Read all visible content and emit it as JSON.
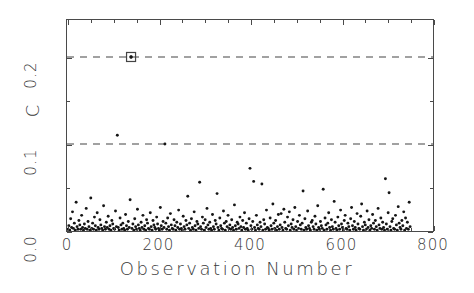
{
  "chart_data": {
    "type": "scatter",
    "title": "",
    "xlabel": "Observation Number",
    "ylabel": "C",
    "xlim": [
      0,
      800
    ],
    "ylim": [
      0.0,
      0.2425
    ],
    "grid": false,
    "legend": null,
    "x_ticks": [
      "0",
      "200",
      "400",
      "600",
      "800"
    ],
    "x_tick_values": [
      0,
      200,
      400,
      600,
      800
    ],
    "x_minor_step": 50,
    "y_ticks": [
      "0.0",
      "0.1",
      "0.2"
    ],
    "y_tick_values": [
      0.0,
      0.1,
      0.2
    ],
    "y_minor_step": 0.05,
    "reference_lines": [
      {
        "y": 0.1,
        "style": "dashed",
        "label": ""
      },
      {
        "y": 0.2,
        "style": "dashed",
        "label": ""
      }
    ],
    "highlighted_point": {
      "x": 140,
      "y": 0.2,
      "marker": "open-square"
    },
    "marker": "filled-dot",
    "point_color": "#151515",
    "n_points": 752,
    "x": [
      2,
      4,
      6,
      8,
      10,
      12,
      14,
      16,
      18,
      20,
      22,
      24,
      26,
      28,
      30,
      32,
      34,
      36,
      38,
      40,
      42,
      44,
      46,
      48,
      50,
      52,
      54,
      56,
      58,
      60,
      62,
      64,
      66,
      68,
      70,
      72,
      74,
      76,
      78,
      80,
      82,
      84,
      86,
      88,
      90,
      92,
      94,
      96,
      98,
      100,
      102,
      104,
      106,
      108,
      110,
      112,
      114,
      116,
      118,
      120,
      122,
      124,
      126,
      128,
      130,
      132,
      134,
      136,
      138,
      140,
      142,
      144,
      146,
      148,
      150,
      152,
      154,
      156,
      158,
      160,
      162,
      164,
      166,
      168,
      170,
      172,
      174,
      176,
      178,
      180,
      182,
      184,
      186,
      188,
      190,
      192,
      194,
      196,
      198,
      200,
      202,
      204,
      206,
      208,
      210,
      212,
      214,
      216,
      218,
      220,
      222,
      224,
      226,
      228,
      230,
      232,
      234,
      236,
      238,
      240,
      242,
      244,
      246,
      248,
      250,
      252,
      254,
      256,
      258,
      260,
      262,
      264,
      266,
      268,
      270,
      272,
      274,
      276,
      278,
      280,
      282,
      284,
      286,
      288,
      290,
      292,
      294,
      296,
      298,
      300,
      302,
      304,
      306,
      308,
      310,
      312,
      314,
      316,
      318,
      320,
      322,
      324,
      326,
      328,
      330,
      332,
      334,
      336,
      338,
      340,
      342,
      344,
      346,
      348,
      350,
      352,
      354,
      356,
      358,
      360,
      362,
      364,
      366,
      368,
      370,
      372,
      374,
      376,
      378,
      380,
      382,
      384,
      386,
      388,
      390,
      392,
      394,
      396,
      398,
      400,
      402,
      404,
      406,
      408,
      410,
      412,
      414,
      416,
      418,
      420,
      422,
      424,
      426,
      428,
      430,
      432,
      434,
      436,
      438,
      440,
      442,
      444,
      446,
      448,
      450,
      452,
      454,
      456,
      458,
      460,
      462,
      464,
      466,
      468,
      470,
      472,
      474,
      476,
      478,
      480,
      482,
      484,
      486,
      488,
      490,
      492,
      494,
      496,
      498,
      500,
      502,
      504,
      506,
      508,
      510,
      512,
      514,
      516,
      518,
      520,
      522,
      524,
      526,
      528,
      530,
      532,
      534,
      536,
      538,
      540,
      542,
      544,
      546,
      548,
      550,
      552,
      554,
      556,
      558,
      560,
      562,
      564,
      566,
      568,
      570,
      572,
      574,
      576,
      578,
      580,
      582,
      584,
      586,
      588,
      590,
      592,
      594,
      596,
      598,
      600,
      602,
      604,
      606,
      608,
      610,
      612,
      614,
      616,
      618,
      620,
      622,
      624,
      626,
      628,
      630,
      632,
      634,
      636,
      638,
      640,
      642,
      644,
      646,
      648,
      650,
      652,
      654,
      656,
      658,
      660,
      662,
      664,
      666,
      668,
      670,
      672,
      674,
      676,
      678,
      680,
      682,
      684,
      686,
      688,
      690,
      692,
      694,
      696,
      698,
      700,
      702,
      704,
      706,
      708,
      710,
      712,
      714,
      716,
      718,
      720,
      722,
      724,
      726,
      728,
      730,
      732,
      734,
      736,
      738,
      740,
      742,
      744,
      746,
      748,
      750
    ],
    "y": [
      0.002,
      0.006,
      0.001,
      0.014,
      0.004,
      0.022,
      0.003,
      0.009,
      0.001,
      0.033,
      0.005,
      0.002,
      0.012,
      0.007,
      0.002,
      0.018,
      0.004,
      0.001,
      0.008,
      0.003,
      0.026,
      0.002,
      0.011,
      0.005,
      0.001,
      0.038,
      0.003,
      0.009,
      0.002,
      0.016,
      0.006,
      0.001,
      0.021,
      0.004,
      0.002,
      0.013,
      0.007,
      0.003,
      0.001,
      0.029,
      0.005,
      0.002,
      0.01,
      0.004,
      0.017,
      0.002,
      0.006,
      0.001,
      0.012,
      0.008,
      0.003,
      0.002,
      0.023,
      0.005,
      0.11,
      0.004,
      0.001,
      0.015,
      0.007,
      0.002,
      0.009,
      0.003,
      0.001,
      0.019,
      0.006,
      0.002,
      0.011,
      0.004,
      0.036,
      0.2,
      0.003,
      0.008,
      0.001,
      0.014,
      0.005,
      0.002,
      0.025,
      0.007,
      0.003,
      0.001,
      0.01,
      0.004,
      0.018,
      0.002,
      0.006,
      0.001,
      0.013,
      0.009,
      0.003,
      0.002,
      0.021,
      0.005,
      0.001,
      0.012,
      0.007,
      0.004,
      0.002,
      0.016,
      0.008,
      0.003,
      0.001,
      0.027,
      0.006,
      0.002,
      0.011,
      0.004,
      0.1,
      0.009,
      0.002,
      0.015,
      0.005,
      0.001,
      0.02,
      0.007,
      0.003,
      0.002,
      0.013,
      0.006,
      0.001,
      0.01,
      0.004,
      0.024,
      0.002,
      0.008,
      0.003,
      0.001,
      0.017,
      0.005,
      0.002,
      0.012,
      0.007,
      0.04,
      0.003,
      0.009,
      0.001,
      0.014,
      0.004,
      0.002,
      0.022,
      0.006,
      0.001,
      0.011,
      0.008,
      0.003,
      0.056,
      0.005,
      0.002,
      0.016,
      0.009,
      0.001,
      0.013,
      0.004,
      0.026,
      0.007,
      0.002,
      0.01,
      0.003,
      0.001,
      0.019,
      0.005,
      0.002,
      0.012,
      0.008,
      0.043,
      0.004,
      0.001,
      0.015,
      0.006,
      0.003,
      0.002,
      0.023,
      0.009,
      0.001,
      0.011,
      0.005,
      0.018,
      0.003,
      0.007,
      0.002,
      0.013,
      0.004,
      0.001,
      0.03,
      0.006,
      0.002,
      0.01,
      0.008,
      0.003,
      0.016,
      0.005,
      0.001,
      0.012,
      0.004,
      0.021,
      0.002,
      0.009,
      0.003,
      0.001,
      0.014,
      0.072,
      0.006,
      0.002,
      0.011,
      0.057,
      0.004,
      0.001,
      0.018,
      0.007,
      0.003,
      0.002,
      0.01,
      0.005,
      0.054,
      0.001,
      0.013,
      0.008,
      0.002,
      0.024,
      0.004,
      0.003,
      0.001,
      0.015,
      0.006,
      0.002,
      0.031,
      0.009,
      0.003,
      0.012,
      0.001,
      0.005,
      0.019,
      0.002,
      0.007,
      0.02,
      0.004,
      0.001,
      0.025,
      0.01,
      0.003,
      0.002,
      0.016,
      0.006,
      0.022,
      0.001,
      0.008,
      0.004,
      0.013,
      0.002,
      0.027,
      0.005,
      0.001,
      0.011,
      0.003,
      0.018,
      0.007,
      0.002,
      0.009,
      0.046,
      0.001,
      0.014,
      0.004,
      0.002,
      0.023,
      0.006,
      0.003,
      0.001,
      0.01,
      0.012,
      0.005,
      0.002,
      0.017,
      0.008,
      0.001,
      0.029,
      0.004,
      0.002,
      0.011,
      0.006,
      0.003,
      0.048,
      0.001,
      0.015,
      0.007,
      0.002,
      0.009,
      0.021,
      0.004,
      0.001,
      0.013,
      0.005,
      0.002,
      0.034,
      0.01,
      0.003,
      0.001,
      0.016,
      0.006,
      0.002,
      0.024,
      0.008,
      0.004,
      0.001,
      0.012,
      0.018,
      0.003,
      0.002,
      0.009,
      0.005,
      0.001,
      0.014,
      0.027,
      0.006,
      0.002,
      0.011,
      0.004,
      0.001,
      0.02,
      0.008,
      0.003,
      0.002,
      0.017,
      0.031,
      0.005,
      0.001,
      0.01,
      0.007,
      0.002,
      0.023,
      0.004,
      0.013,
      0.001,
      0.006,
      0.003,
      0.019,
      0.009,
      0.002,
      0.012,
      0.005,
      0.001,
      0.026,
      0.007,
      0.003,
      0.015,
      0.002,
      0.01,
      0.004,
      0.001,
      0.06,
      0.008,
      0.002,
      0.021,
      0.044,
      0.005,
      0.001,
      0.011,
      0.014,
      0.003,
      0.002,
      0.018,
      0.007,
      0.001,
      0.028,
      0.009,
      0.004,
      0.002,
      0.012,
      0.006,
      0.022,
      0.001,
      0.015,
      0.003,
      0.01,
      0.002,
      0.033,
      0.005,
      0.001,
      0.008,
      0.082,
      0.013,
      0.004,
      0.002,
      0.019,
      0.007,
      0.001,
      0.011,
      0.025,
      0.003,
      0.002,
      0.016,
      0.006,
      0.009,
      0.001,
      0.012,
      0.058,
      0.004,
      0.002,
      0.02,
      0.008,
      0.003,
      0.001,
      0.014,
      0.005,
      0.03,
      0.002,
      0.01,
      0.017,
      0.006,
      0.001,
      0.07,
      0.013,
      0.004,
      0.002,
      0.024,
      0.009,
      0.003,
      0.001,
      0.011,
      0.021,
      0.005,
      0.002,
      0.015,
      0.008,
      0.018,
      0.003
    ]
  },
  "axes": {
    "y_title": "C",
    "x_title": "Observation Number"
  }
}
